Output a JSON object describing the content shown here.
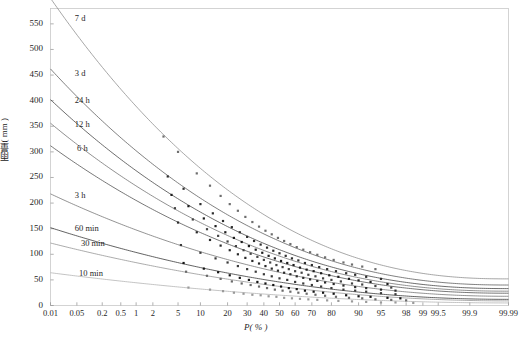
{
  "chart_data": {
    "type": "line",
    "title": "",
    "subtitle": "",
    "xlabel": "P( % )",
    "ylabel": "雨量( mm )",
    "grid": false,
    "legend": "inline-curve-labels",
    "xscale": "probability",
    "xlim": [
      0.01,
      99.99
    ],
    "ylim": [
      0,
      580
    ],
    "yticks": [
      0,
      50,
      100,
      150,
      200,
      250,
      300,
      350,
      400,
      450,
      500,
      550
    ],
    "ytick_labels": [
      "0",
      "50",
      "100",
      "150",
      "200",
      "250",
      "300",
      "350",
      "400",
      "450",
      "500",
      "550"
    ],
    "xticks": [
      0.01,
      0.05,
      0.2,
      0.5,
      1,
      2,
      5,
      10,
      20,
      30,
      40,
      50,
      60,
      70,
      80,
      90,
      95,
      98,
      99,
      99.5,
      99.9,
      99.99
    ],
    "xtick_labels": [
      "0.01",
      "0.05",
      "0.2",
      "0.5",
      "1",
      "2",
      "5",
      "10",
      "20",
      "30",
      "40",
      "50",
      "60",
      "70",
      "80",
      "90",
      "95",
      "98",
      "99",
      "99.5",
      "99.9",
      "99.99"
    ],
    "series": [
      {
        "name": "7 d",
        "label": "7 d",
        "color": "#8a8a8a",
        "marker_color": "#6e6e6e",
        "label_x": 0.035,
        "label_y": 560,
        "fit": {
          "y0": 600,
          "y_end": 52,
          "curvature": 2.35
        },
        "points_p": [
          3.0,
          5.0,
          9.0,
          13.0,
          17.0,
          21.0,
          25.0,
          29.0,
          33.0,
          37.0,
          41.0,
          45.0,
          49.0,
          53.0,
          57.0,
          61.0,
          65.0,
          69.0,
          73.0,
          77.0,
          81.0,
          85.0,
          88.0,
          91.0,
          94.0
        ],
        "points_y": [
          330,
          300,
          258,
          234,
          214,
          198,
          185,
          173,
          163,
          154,
          146,
          139,
          132,
          126,
          120,
          114,
          109,
          104,
          99,
          94,
          89,
          84,
          80,
          76,
          71
        ]
      },
      {
        "name": "3 d",
        "label": "3 d",
        "color": "#555555",
        "marker_color": "#2e2e2e",
        "label_x": 0.035,
        "label_y": 452,
        "fit": {
          "y0": 462,
          "y_end": 40,
          "curvature": 2.3
        },
        "points_p": [
          3.5,
          6.0,
          10.0,
          14.0,
          18.0,
          22.0,
          26.0,
          30.0,
          34.0,
          38.0,
          42.0,
          46.0,
          50.0,
          54.0,
          58.0,
          62.0,
          66.0,
          70.0,
          74.0,
          78.0,
          82.0,
          86.0,
          89.0,
          92.0,
          95.0
        ],
        "points_y": [
          252,
          228,
          198,
          180,
          165,
          153,
          143,
          134,
          126,
          119,
          113,
          107,
          102,
          97,
          92,
          88,
          83,
          79,
          75,
          71,
          67,
          63,
          60,
          56,
          52
        ]
      },
      {
        "name": "24 h",
        "label": "24 h",
        "color": "#3c3c3c",
        "marker_color": "#1c1c1c",
        "label_x": 0.035,
        "label_y": 400,
        "fit": {
          "y0": 402,
          "y_end": 33,
          "curvature": 2.28
        },
        "points_p": [
          4.0,
          7.0,
          11.0,
          15.0,
          19.0,
          23.0,
          27.0,
          31.0,
          35.0,
          39.0,
          43.0,
          47.0,
          51.0,
          55.0,
          59.0,
          63.0,
          67.0,
          71.0,
          75.0,
          79.0,
          83.0,
          87.0,
          90.0,
          93.0,
          96.0
        ],
        "points_y": [
          216,
          194,
          170,
          155,
          143,
          132,
          124,
          116,
          109,
          103,
          97,
          92,
          87,
          83,
          79,
          74,
          70,
          67,
          63,
          59,
          56,
          52,
          49,
          46,
          42
        ]
      },
      {
        "name": "12 h",
        "label": "12 h",
        "color": "#6b6b6b",
        "marker_color": "#444444",
        "label_x": 0.035,
        "label_y": 353,
        "fit": {
          "y0": 356,
          "y_end": 28,
          "curvature": 2.26
        },
        "points_p": [
          4.5,
          8.0,
          12.0,
          16.0,
          20.0,
          24.0,
          28.0,
          32.0,
          36.0,
          40.0,
          44.0,
          48.0,
          52.0,
          56.0,
          60.0,
          64.0,
          68.0,
          72.0,
          76.0,
          80.0,
          84.0,
          88.0,
          91.0,
          94.0,
          96.5
        ],
        "points_y": [
          190,
          168,
          149,
          136,
          125,
          116,
          108,
          101,
          95,
          89,
          84,
          79,
          75,
          71,
          67,
          64,
          60,
          57,
          53,
          50,
          47,
          43,
          41,
          38,
          35
        ]
      },
      {
        "name": "6 h",
        "label": "6 h",
        "color": "#4a4a4a",
        "marker_color": "#2a2a2a",
        "label_x": 0.04,
        "label_y": 305,
        "fit": {
          "y0": 312,
          "y_end": 24,
          "curvature": 2.24
        },
        "points_p": [
          5.0,
          9.0,
          13.0,
          17.0,
          21.0,
          25.0,
          29.0,
          33.0,
          37.0,
          41.0,
          45.0,
          49.0,
          53.0,
          57.0,
          61.0,
          65.0,
          69.0,
          73.0,
          77.0,
          81.0,
          85.0,
          89.0,
          92.0,
          95.0,
          97.0
        ],
        "points_y": [
          162,
          143,
          128,
          117,
          108,
          100,
          93,
          87,
          82,
          77,
          72,
          68,
          64,
          61,
          57,
          54,
          51,
          48,
          45,
          42,
          39,
          36,
          34,
          31,
          29
        ]
      },
      {
        "name": "3 h",
        "label": "3 h",
        "color": "#6f6f6f",
        "marker_color": "#3a3a3a",
        "label_x": 0.035,
        "label_y": 213,
        "fit": {
          "y0": 218,
          "y_end": 18,
          "curvature": 2.1
        },
        "points_p": [
          5.5,
          10.0,
          15.0,
          20.0,
          25.0,
          30.0,
          35.0,
          40.0,
          45.0,
          50.0,
          55.0,
          60.0,
          65.0,
          70.0,
          75.0,
          80.0,
          85.0,
          89.0,
          92.0,
          95.0,
          97.0
        ],
        "points_y": [
          118,
          103,
          92,
          84,
          77,
          71,
          66,
          61,
          57,
          53,
          50,
          46,
          43,
          40,
          37,
          34,
          31,
          29,
          27,
          24,
          22
        ]
      },
      {
        "name": "60 min",
        "label": "60 min",
        "color": "#2f2f2f",
        "marker_color": "#141414",
        "label_x": 0.035,
        "label_y": 150,
        "fit": {
          "y0": 152,
          "y_end": 12,
          "curvature": 2.05
        },
        "points_p": [
          6.0,
          11.0,
          16.0,
          21.0,
          26.0,
          31.0,
          36.0,
          41.0,
          46.0,
          51.0,
          56.0,
          61.0,
          66.0,
          71.0,
          76.0,
          81.0,
          86.0,
          90.0,
          93.0,
          96.0,
          97.5
        ],
        "points_y": [
          83,
          72,
          65,
          59,
          54,
          50,
          46,
          43,
          40,
          37,
          34,
          32,
          29,
          27,
          25,
          23,
          20,
          18,
          17,
          15,
          14
        ]
      },
      {
        "name": "30 min",
        "label": "30 min",
        "color": "#909090",
        "marker_color": "#6a6a6a",
        "label_x": 0.05,
        "label_y": 120,
        "fit": {
          "y0": 122,
          "y_end": 9,
          "curvature": 2.0
        },
        "points_p": [
          6.5,
          12.0,
          17.0,
          22.0,
          27.0,
          32.0,
          37.0,
          42.0,
          47.0,
          52.0,
          57.0,
          62.0,
          67.0,
          72.0,
          77.0,
          82.0,
          87.0,
          91.0,
          94.0,
          96.5,
          98.0
        ],
        "points_y": [
          66,
          58,
          52,
          47,
          43,
          40,
          37,
          34,
          31,
          29,
          27,
          25,
          23,
          21,
          19,
          17,
          15,
          14,
          12,
          11,
          10
        ]
      },
      {
        "name": "10 min",
        "label": "10 min",
        "color": "#b0b0b0",
        "marker_color": "#9a9a9a",
        "label_x": 0.045,
        "label_y": 62,
        "fit": {
          "y0": 64,
          "y_end": 5,
          "curvature": 1.95
        },
        "points_p": [
          7.0,
          13.0,
          18.0,
          23.0,
          28.0,
          33.0,
          38.0,
          43.0,
          48.0,
          53.0,
          58.0,
          63.0,
          68.0,
          73.0,
          78.0,
          83.0,
          88.0,
          92.0,
          95.0,
          97.0,
          98.5
        ],
        "points_y": [
          35,
          31,
          28,
          25,
          23,
          21,
          20,
          18,
          17,
          15,
          14,
          13,
          12,
          11,
          10,
          9,
          8,
          7,
          6,
          6,
          5
        ]
      }
    ]
  },
  "axes": {
    "ylabel_text": "雨量( mm )",
    "xlabel_text": "P( % )"
  }
}
